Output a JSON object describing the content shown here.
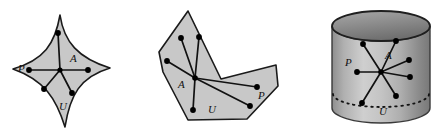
{
  "figure": {
    "caption": "",
    "background_color": "#ffffff",
    "fill_color": "#c8c8c8",
    "stroke_color": "#1a1a1a",
    "dot_color": "#000000",
    "panels": [
      {
        "id": "astroid-panel",
        "shape_name": "astroid-region",
        "labels": {
          "center": "A",
          "boundary_point": "P",
          "region": "U"
        },
        "center_point": {
          "x": 60,
          "y": 70
        },
        "spoke_endpoints": [
          {
            "x": 58,
            "y": 33
          },
          {
            "x": 29,
            "y": 70
          },
          {
            "x": 88,
            "y": 70
          },
          {
            "x": 44,
            "y": 89
          },
          {
            "x": 72,
            "y": 93
          }
        ],
        "outline_tips": [
          {
            "x": 60,
            "y": 15
          },
          {
            "x": 110,
            "y": 68
          },
          {
            "x": 65,
            "y": 127
          },
          {
            "x": 13,
            "y": 69
          }
        ]
      },
      {
        "id": "polygon-panel",
        "shape_name": "nonconvex-polygon-region",
        "labels": {
          "center": "A",
          "boundary_point": "P",
          "region": "U"
        },
        "center_point": {
          "x": 195,
          "y": 78
        },
        "spoke_endpoints": [
          {
            "x": 181,
            "y": 38
          },
          {
            "x": 199,
            "y": 37
          },
          {
            "x": 167,
            "y": 61
          },
          {
            "x": 193,
            "y": 110
          },
          {
            "x": 250,
            "y": 106
          },
          {
            "x": 257,
            "y": 87
          }
        ],
        "outline_vertices": [
          {
            "x": 188,
            "y": 11
          },
          {
            "x": 221,
            "y": 79
          },
          {
            "x": 276,
            "y": 65
          },
          {
            "x": 278,
            "y": 86
          },
          {
            "x": 247,
            "y": 119
          },
          {
            "x": 188,
            "y": 120
          },
          {
            "x": 163,
            "y": 72
          },
          {
            "x": 159,
            "y": 52
          }
        ]
      },
      {
        "id": "cylinder-panel",
        "shape_name": "cylinder-region",
        "labels": {
          "center": "A",
          "boundary_point": "P",
          "region": "U"
        },
        "center_point": {
          "x": 381,
          "y": 72
        },
        "spoke_endpoints": [
          {
            "x": 363,
            "y": 44
          },
          {
            "x": 396,
            "y": 41
          },
          {
            "x": 409,
            "y": 60
          },
          {
            "x": 410,
            "y": 77
          },
          {
            "x": 357,
            "y": 72
          },
          {
            "x": 362,
            "y": 103
          },
          {
            "x": 396,
            "y": 96
          }
        ],
        "cylinder": {
          "center_x": 381,
          "radius_x": 49,
          "top_y": 26,
          "bottom_y": 108,
          "ellipse_ry": 15,
          "dashed_ellipse_y": 96
        }
      }
    ]
  }
}
